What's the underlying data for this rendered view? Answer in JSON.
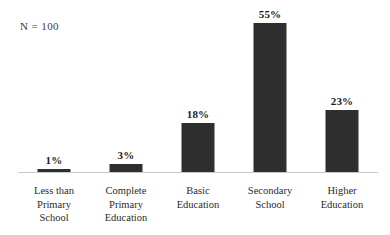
{
  "chart_data": {
    "type": "bar",
    "title": "",
    "subtitle": "",
    "xlabel": "",
    "ylabel": "",
    "ylim": [
      0,
      60
    ],
    "grid": false,
    "legend": null,
    "annotation": "N = 100",
    "categories": [
      "Less than Primary School",
      "Complete Primary Education",
      "Basic Education",
      "Secondary School",
      "Higher Education"
    ],
    "category_lines": [
      [
        "Less than",
        "Primary",
        "School"
      ],
      [
        "Complete",
        "Primary",
        "Education"
      ],
      [
        "Basic",
        "Education"
      ],
      [
        "Secondary",
        "School"
      ],
      [
        "Higher",
        "Education"
      ]
    ],
    "values": [
      1,
      3,
      18,
      55,
      23
    ],
    "value_labels": [
      "1%",
      "3%",
      "18%",
      "55%",
      "23%"
    ],
    "bar_color": "#2e2e2e",
    "axis_color": "#c9c9c9",
    "background_color": "#ffffff"
  }
}
